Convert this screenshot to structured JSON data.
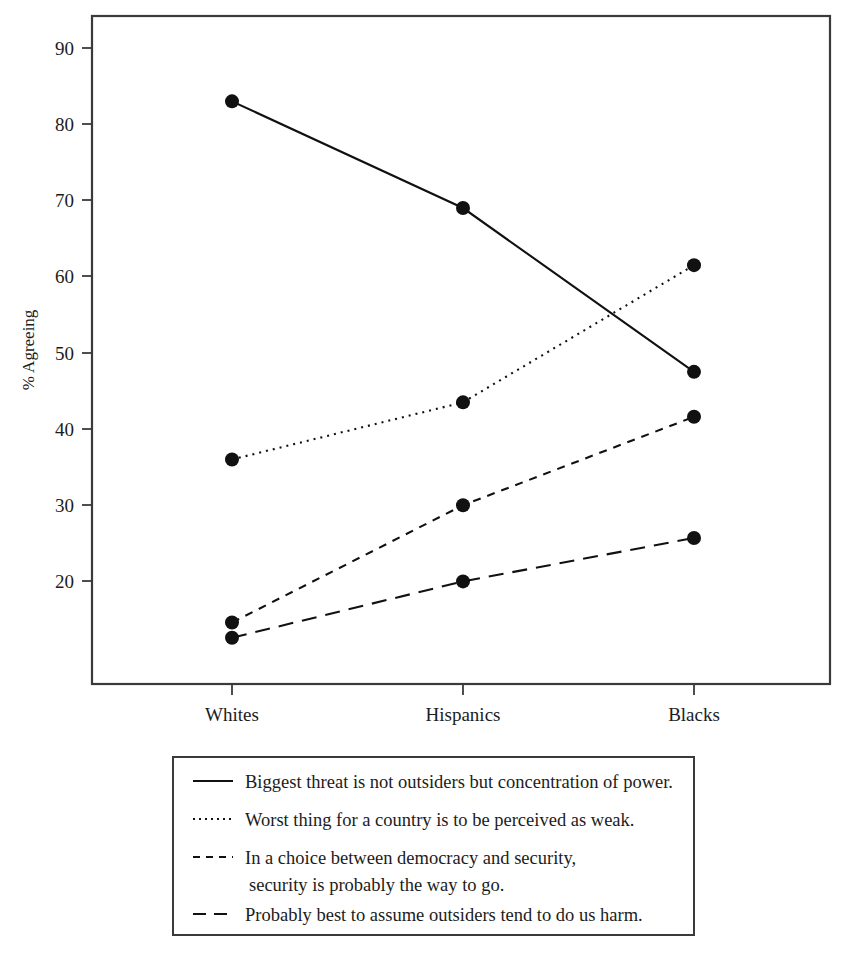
{
  "chart_data": {
    "type": "line",
    "title": "",
    "xlabel": "",
    "ylabel": "% Agreeing",
    "categories": [
      "Whites",
      "Hispanics",
      "Blacks"
    ],
    "ylim": [
      10,
      95
    ],
    "yticks": [
      20,
      30,
      40,
      50,
      60,
      70,
      80,
      90
    ],
    "ytick_labels": [
      "20",
      "30",
      "40",
      "50",
      "60",
      "70",
      "80",
      "90"
    ],
    "grid": false,
    "legend_position": "below-plot",
    "series": [
      {
        "name": "Biggest threat is not outsiders but concentration of power.",
        "style": "solid",
        "values": [
          83,
          69,
          47.5
        ]
      },
      {
        "name": "Worst thing for a country is to be perceived as weak.",
        "style": "dotted",
        "values": [
          36,
          43.5,
          61.5
        ]
      },
      {
        "name": "In a choice between democracy and security, security is probably the way to go.",
        "style": "dashed-short",
        "values": [
          14.6,
          30,
          41.6
        ]
      },
      {
        "name": "Probably best to assume outsiders tend to do us harm.",
        "style": "dashed-long",
        "values": [
          12.6,
          20,
          25.7
        ]
      }
    ],
    "colors": {
      "line": "#111111",
      "frame": "#3a3a3a",
      "text": "#1c1c1c",
      "background": "#ffffff"
    }
  },
  "legend": {
    "entries": [
      {
        "label": "Biggest threat is not outsiders but concentration of power.",
        "line2": ""
      },
      {
        "label": "Worst thing for a country is to be perceived as weak.",
        "line2": ""
      },
      {
        "label": "In a choice between democracy and security,",
        "line2": "security is probably the way to go."
      },
      {
        "label": "Probably best to assume outsiders tend to do us harm.",
        "line2": ""
      }
    ]
  },
  "axes": {
    "y_title": "% Agreeing",
    "y_ticks": [
      "90",
      "80",
      "70",
      "60",
      "50",
      "40",
      "30",
      "20"
    ],
    "x_ticks": [
      "Whites",
      "Hispanics",
      "Blacks"
    ]
  }
}
